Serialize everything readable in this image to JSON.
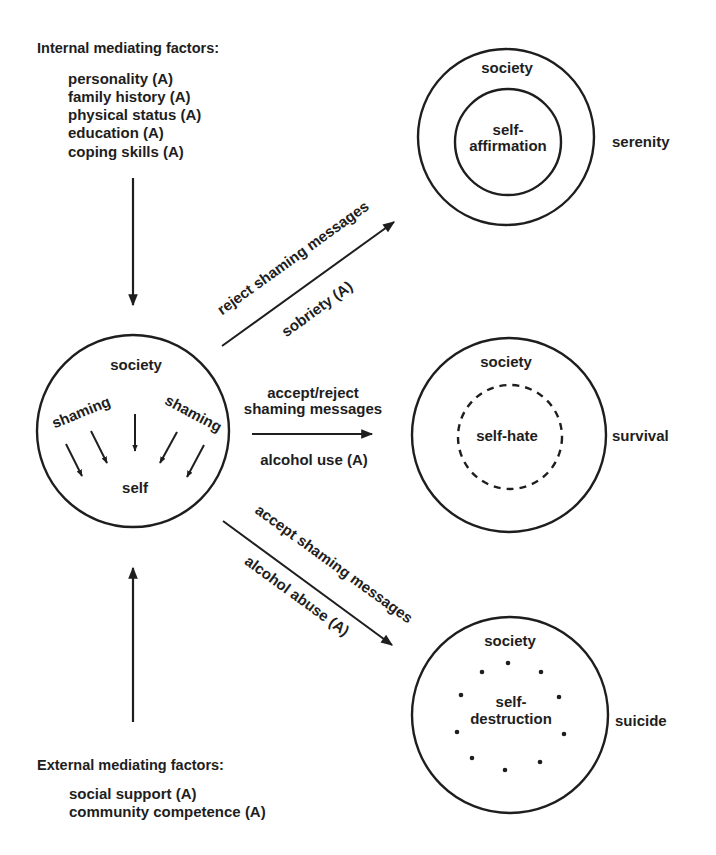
{
  "internal_factors": {
    "heading": "Internal mediating factors:",
    "items": [
      "personality (A)",
      "family history (A)",
      "physical status (A)",
      "education (A)",
      "coping skills (A)"
    ]
  },
  "external_factors": {
    "heading": "External mediating factors:",
    "items": [
      "social support (A)",
      "community competence (A)"
    ]
  },
  "central_circle": {
    "outer_label": "society",
    "left_arc_label": "shaming",
    "right_arc_label": "shaming",
    "inner_label": "self"
  },
  "paths": [
    {
      "upper_label": "reject shaming messages",
      "lower_label": "sobriety (A)"
    },
    {
      "upper_label_line1": "accept/reject",
      "upper_label_line2": "shaming messages",
      "lower_label": "alcohol use (A)"
    },
    {
      "upper_label": "accept shaming messages",
      "lower_label": "alcohol abuse (A)"
    }
  ],
  "outcomes": [
    {
      "outer_label": "society",
      "inner_line1": "self-",
      "inner_line2": "affirmation",
      "result": "serenity",
      "inner_style": "solid"
    },
    {
      "outer_label": "society",
      "inner_line1": "self-hate",
      "result": "survival",
      "inner_style": "dashed"
    },
    {
      "outer_label": "society",
      "inner_line1": "self-",
      "inner_line2": "destruction",
      "result": "suicide",
      "inner_style": "dotted"
    }
  ],
  "colors": {
    "ink": "#1e1e1e",
    "background": "#ffffff"
  }
}
